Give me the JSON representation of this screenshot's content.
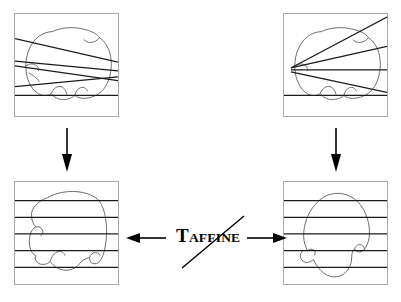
{
  "figure": {
    "background_color": "#ffffff",
    "box_border_color": "#a8a8a8",
    "line_color": "#1a1a1a",
    "contour_color": "#555555",
    "arrow_color": "#000000"
  },
  "label": {
    "symbol": "T",
    "subscript": "AFFINE",
    "full_text": "TAFFINE",
    "struck_through": true
  },
  "panels": [
    {
      "id": "top-left",
      "name": "source-image-slanted-lines",
      "line_family": "slanted-parallel",
      "line_count": 4,
      "contour": "hand-drawn-blob"
    },
    {
      "id": "top-right",
      "name": "target-image-fan-lines",
      "line_family": "fan-converging-left",
      "line_count": 4,
      "contour": "hand-drawn-blob"
    },
    {
      "id": "bottom-left",
      "name": "rectified-image-left",
      "line_family": "horizontal-parallel",
      "line_count": 5,
      "contour": "hand-drawn-blob"
    },
    {
      "id": "bottom-right",
      "name": "rectified-image-right",
      "line_family": "horizontal-parallel",
      "line_count": 5,
      "contour": "hand-drawn-blob"
    }
  ],
  "arrows": [
    {
      "id": "left-down",
      "name": "arrow-down-left",
      "direction": "down"
    },
    {
      "id": "right-down",
      "name": "arrow-down-right",
      "direction": "down"
    },
    {
      "id": "to-left",
      "name": "arrow-left",
      "direction": "left"
    },
    {
      "id": "to-right",
      "name": "arrow-right",
      "direction": "right"
    }
  ]
}
